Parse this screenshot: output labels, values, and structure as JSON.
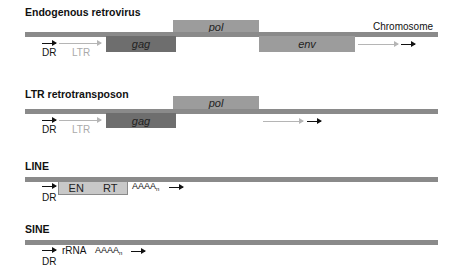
{
  "rows": [
    {
      "title": "Endogenous retrovirus",
      "chromosome_label": "Chromosome",
      "domains": {
        "gag": "gag",
        "pol": "pol",
        "env": "env"
      },
      "labels": {
        "dr": "DR",
        "ltr": "LTR"
      }
    },
    {
      "title": "LTR retrotransposon",
      "domains": {
        "gag": "gag",
        "pol": "pol"
      },
      "labels": {
        "dr": "DR",
        "ltr": "LTR"
      }
    },
    {
      "title": "LINE",
      "domains": {
        "en": "EN",
        "rt": "RT"
      },
      "labels": {
        "dr": "DR",
        "polya": "AAAA",
        "polya_sub": "n"
      }
    },
    {
      "title": "SINE",
      "labels": {
        "dr": "DR",
        "rrna": "rRNA",
        "polya": "AAAA",
        "polya_sub": "n"
      }
    }
  ],
  "colors": {
    "chromosome": "#8a8a8a",
    "gag": "#6e6e6e",
    "pol_env": "#9c9c9c",
    "line_orf": "#c8c8c8",
    "ltr_arrow": "#b5b5b5",
    "dr_arrow": "#111111"
  }
}
